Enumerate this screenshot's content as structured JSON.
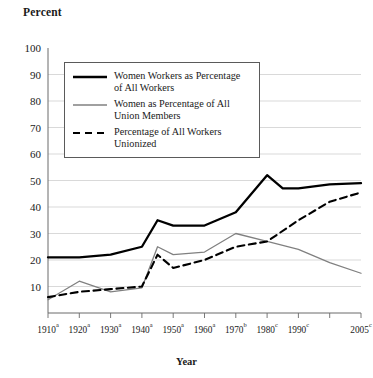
{
  "chart_data": {
    "type": "line",
    "title": "",
    "ylabel": "Percent",
    "xlabel": "Year",
    "ylim": [
      0,
      100
    ],
    "yticks": [
      10,
      20,
      30,
      40,
      50,
      60,
      70,
      80,
      90,
      100
    ],
    "grid": "horizontal",
    "legend_position": "upper-left-inside",
    "categories": [
      "1910",
      "1920",
      "1930",
      "1940",
      "1950",
      "1960",
      "1970",
      "1980",
      "1990",
      "2000",
      "2005"
    ],
    "category_labels": [
      {
        "year": "1910",
        "note": "a"
      },
      {
        "year": "1920",
        "note": "a"
      },
      {
        "year": "1930",
        "note": "a"
      },
      {
        "year": "1940",
        "note": "a"
      },
      {
        "year": "1950",
        "note": "a"
      },
      {
        "year": "1960",
        "note": "a"
      },
      {
        "year": "1970",
        "note": "b"
      },
      {
        "year": "1980",
        "note": "c"
      },
      {
        "year": "1990",
        "note": "c"
      },
      {
        "year": "",
        "note": ""
      },
      {
        "year": "2005",
        "note": "c"
      }
    ],
    "series": [
      {
        "name": "Women Workers as Percentage of All Workers",
        "style": "solid-thick",
        "color": "#000000",
        "x": [
          "1910",
          "1920",
          "1930",
          "1940",
          "1945",
          "1950",
          "1960",
          "1970",
          "1980",
          "1985",
          "1990",
          "2000",
          "2005"
        ],
        "values": [
          21,
          21,
          22,
          25,
          35,
          33,
          33,
          38,
          52,
          47,
          47,
          48.5,
          49
        ]
      },
      {
        "name": "Women as Percentage of All Union Members",
        "style": "solid-thin",
        "color": "#808080",
        "x": [
          "1910",
          "1920",
          "1930",
          "1940",
          "1945",
          "1950",
          "1960",
          "1970",
          "1980",
          "1990",
          "2000",
          "2005"
        ],
        "values": [
          5,
          12,
          8,
          9.5,
          25,
          22,
          23,
          30,
          27,
          24,
          19,
          15
        ]
      },
      {
        "name": "Percentage of All Workers Unionized",
        "style": "dashed",
        "color": "#000000",
        "x": [
          "1910",
          "1920",
          "1930",
          "1940",
          "1945",
          "1950",
          "1960",
          "1970",
          "1980",
          "1990",
          "2000",
          "2005"
        ],
        "values": [
          6,
          8,
          9,
          10,
          22,
          17,
          20,
          25,
          27,
          35,
          42,
          45.5
        ]
      }
    ]
  },
  "legend": {
    "items": [
      {
        "label_line1": "Women Workers as Percentage",
        "label_line2": "of All Workers",
        "key": "solid-thick-line-key"
      },
      {
        "label_line1": "Women as Percentage of All",
        "label_line2": "Union Members",
        "key": "solid-thin-line-key"
      },
      {
        "label_line1": "Percentage of All Workers",
        "label_line2": "Unionized",
        "key": "dashed-line-key"
      }
    ]
  }
}
